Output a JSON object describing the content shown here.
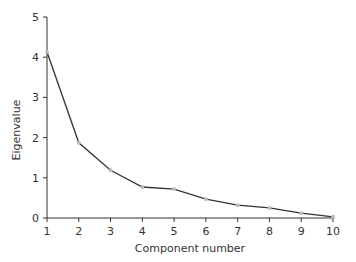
{
  "chart_data": {
    "type": "line",
    "title": "",
    "xlabel": "Component number",
    "ylabel": "Eigenvalue",
    "x": [
      1,
      2,
      3,
      4,
      5,
      6,
      7,
      8,
      9,
      10
    ],
    "series": [
      {
        "name": "Eigenvalue",
        "values": [
          4.13,
          1.87,
          1.19,
          0.77,
          0.72,
          0.47,
          0.32,
          0.25,
          0.12,
          0.03
        ]
      }
    ],
    "xlim": [
      1,
      10
    ],
    "ylim": [
      0,
      5
    ],
    "xticks": [
      "1",
      "2",
      "3",
      "4",
      "5",
      "6",
      "7",
      "8",
      "9",
      "10"
    ],
    "yticks": [
      "0",
      "1",
      "2",
      "3",
      "4",
      "5"
    ],
    "grid": false,
    "legend": null,
    "colors": {
      "line": "#333333",
      "marker": "#bbbbbb",
      "axis": "#333333"
    }
  }
}
